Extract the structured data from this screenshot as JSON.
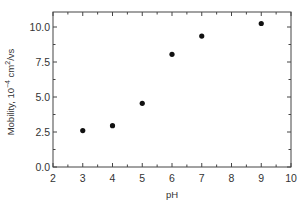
{
  "chart_data": {
    "type": "scatter",
    "title": "",
    "xlabel": "pH",
    "ylabel": "Mobility, 10^-4 cm^2/vs",
    "ylabel_parts": {
      "base": "Mobility, 10",
      "exp1": "−4",
      "mid": " cm",
      "exp2": "2",
      "tail": "/vs"
    },
    "xlim": [
      2,
      10
    ],
    "ylim": [
      0,
      10.75
    ],
    "x_ticks": [
      2,
      3,
      4,
      5,
      6,
      7,
      8,
      9,
      10
    ],
    "x_tick_labels": [
      "2",
      "3",
      "4",
      "5",
      "6",
      "7",
      "8",
      "9",
      "10"
    ],
    "y_ticks": [
      0,
      2.5,
      5,
      7.5,
      10
    ],
    "y_tick_labels": [
      "0.0",
      "2.5",
      "5.0",
      "7.5",
      "10.0"
    ],
    "grid": false,
    "legend": null,
    "series": [
      {
        "name": "Mobility",
        "marker": "filled-circle",
        "color": "#111111",
        "x": [
          3,
          4,
          5,
          6,
          7,
          9
        ],
        "y": [
          2.6,
          2.95,
          4.55,
          8.05,
          9.35,
          10.25
        ]
      }
    ]
  }
}
